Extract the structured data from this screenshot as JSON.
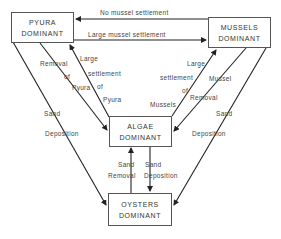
{
  "nodes": {
    "pyura": {
      "line1": "PYURA",
      "line2": "DOMINANT"
    },
    "mussels": {
      "line1": "MUSSELS",
      "line2": "DOMINANT"
    },
    "algae": {
      "line1": "ALGAE",
      "line2": "DOMINANT"
    },
    "oysters": {
      "line1": "OYSTERS",
      "line2": "DOMINANT"
    }
  },
  "edges": {
    "mussels_to_pyura": "No mussel settlement",
    "pyura_to_mussels": "Large mussel settlement",
    "pyura_to_algae": {
      "l1": "Removal",
      "l2": "of",
      "l3": "Pyura"
    },
    "algae_to_pyura": {
      "l1": "Large",
      "l2": "settlement",
      "l3": "of",
      "l4": "Pyura"
    },
    "algae_to_mussels": {
      "l1": "Large",
      "l2": "settlement",
      "l3": "of",
      "l4": "Mussels"
    },
    "mussels_to_algae": {
      "l1": "Mussel",
      "l2": "Removal"
    },
    "pyura_to_oysters": {
      "l1": "Sand",
      "l2": "Deposition"
    },
    "mussels_to_oysters": {
      "l1": "Sand",
      "l2": "Deposition"
    },
    "oysters_to_algae": {
      "l1": "Sand",
      "l2": "Removal"
    },
    "algae_to_oysters": {
      "l1": "Sand",
      "l2": "Deposition"
    }
  },
  "colors": {
    "line": "#222222",
    "box_border": "#555555",
    "text": "#333333"
  }
}
